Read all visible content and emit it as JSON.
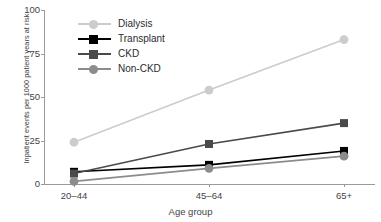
{
  "chart_data": {
    "type": "line",
    "title": "",
    "xlabel": "Age group",
    "ylabel": "Inpatient events per 1000 patient years at risk",
    "categories": [
      "20–44",
      "45–64",
      "65+"
    ],
    "yticks": [
      0,
      25,
      50,
      75,
      100
    ],
    "ylim": [
      0,
      100
    ],
    "grid": false,
    "legend_position": "upper-left-inside",
    "series": [
      {
        "name": "Dialysis",
        "values": [
          24,
          54,
          83
        ],
        "color": "#cccccc",
        "marker": "circle"
      },
      {
        "name": "Transplant",
        "values": [
          7,
          11,
          19
        ],
        "color": "#000000",
        "marker": "square"
      },
      {
        "name": "CKD",
        "values": [
          6,
          23,
          35
        ],
        "color": "#4a4a4a",
        "marker": "square"
      },
      {
        "name": "Non-CKD",
        "values": [
          1.5,
          9,
          16
        ],
        "color": "#8c8c8c",
        "marker": "circle"
      }
    ]
  },
  "axes": {
    "y_tick_labels": [
      "0",
      "25",
      "50",
      "75",
      "100"
    ],
    "x_tick_labels": [
      "20–44",
      "45–64",
      "65+"
    ],
    "x_axis_title": "Age group",
    "y_axis_title": "Inpatient events per 1000 patient years at risk"
  },
  "legend": {
    "entries": [
      {
        "label": "Dialysis"
      },
      {
        "label": "Transplant"
      },
      {
        "label": "CKD"
      },
      {
        "label": "Non-CKD"
      }
    ]
  }
}
